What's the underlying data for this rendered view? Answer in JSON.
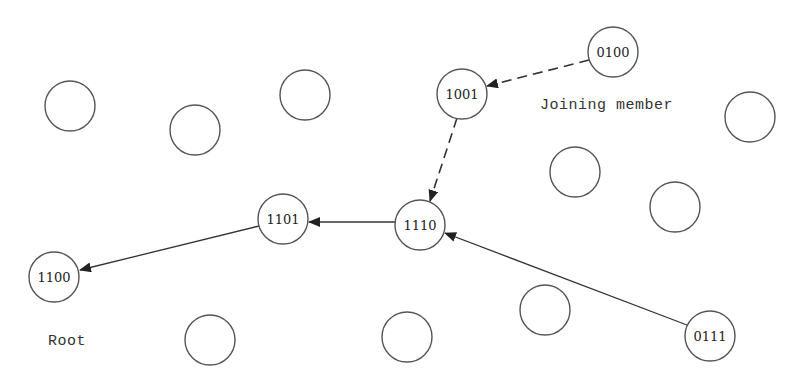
{
  "diagram": {
    "type": "network-tree",
    "node_radius": 25,
    "colors": {
      "stroke": "#555555",
      "text": "#222222",
      "edge": "#333333",
      "background": "#ffffff"
    },
    "labeled_nodes": [
      {
        "id": "n0100",
        "label": "0100",
        "x": 613,
        "y": 52
      },
      {
        "id": "n1001",
        "label": "1001",
        "x": 462,
        "y": 94
      },
      {
        "id": "n1101",
        "label": "1101",
        "x": 283,
        "y": 219
      },
      {
        "id": "n1110",
        "label": "1110",
        "x": 420,
        "y": 225
      },
      {
        "id": "n1100",
        "label": "1100",
        "x": 54,
        "y": 277
      },
      {
        "id": "n0111",
        "label": "0111",
        "x": 710,
        "y": 336
      }
    ],
    "empty_nodes": [
      {
        "x": 70,
        "y": 106
      },
      {
        "x": 195,
        "y": 130
      },
      {
        "x": 305,
        "y": 95
      },
      {
        "x": 750,
        "y": 117
      },
      {
        "x": 575,
        "y": 172
      },
      {
        "x": 675,
        "y": 207
      },
      {
        "x": 210,
        "y": 340
      },
      {
        "x": 407,
        "y": 337
      },
      {
        "x": 545,
        "y": 310
      }
    ],
    "edges": [
      {
        "from": "0100",
        "to": "1001",
        "style": "dashed"
      },
      {
        "from": "1001",
        "to": "1110",
        "style": "dashed"
      },
      {
        "from": "1110",
        "to": "1101",
        "style": "solid"
      },
      {
        "from": "1101",
        "to": "1100",
        "style": "solid"
      },
      {
        "from": "0111",
        "to": "1110",
        "style": "solid"
      }
    ],
    "captions": {
      "joining_member": "Joining member",
      "root": "Root"
    }
  }
}
